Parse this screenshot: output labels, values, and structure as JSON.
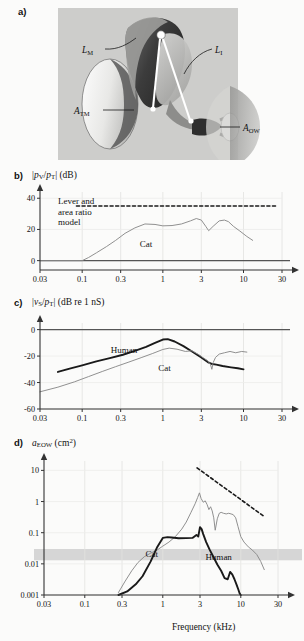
{
  "figure": {
    "background": "#fbfbfa",
    "panels": [
      "a",
      "b",
      "c",
      "d"
    ]
  },
  "panel_a": {
    "letter": "a)",
    "type": "anatomical-diagram",
    "description": "Middle ear ossicular lever diagram",
    "labels": [
      {
        "id": "lm",
        "base": "L",
        "sub": "M"
      },
      {
        "id": "li",
        "base": "L",
        "sub": "I"
      },
      {
        "id": "atm",
        "base": "A",
        "sub": "TM"
      },
      {
        "id": "aow",
        "base": "A",
        "sub": "OW"
      }
    ],
    "colors": {
      "backdrop": "#cfcfcf",
      "membrane": "#f2f2f0",
      "shadow": "#3a3a3a",
      "mid": "#8f8f8f",
      "light": "#bdbdbd"
    }
  },
  "panel_b": {
    "letter": "b)",
    "axis_title_parts": {
      "pre": "|",
      "num": "p",
      "num_sub": "V",
      "slash": "/",
      "den": "p",
      "den_sub": "T",
      "post": "| (dB)"
    },
    "model_label_lines": [
      "Lever and",
      "area ratio",
      "model"
    ],
    "curve_label": "Cat",
    "chart_data": {
      "type": "line",
      "title": "",
      "xlabel": "",
      "ylabel": "|pV/pT| (dB)",
      "xscale": "log",
      "xlim": [
        0.03,
        30
      ],
      "ylim": [
        -6,
        44
      ],
      "xticks": [
        0.03,
        0.1,
        0.3,
        1,
        3,
        10,
        30
      ],
      "xticklabels": [
        "0.03",
        "0.1",
        "0.3",
        "1",
        "3",
        "10",
        "30"
      ],
      "yticks": [
        0,
        20,
        40
      ],
      "yticklabels": [
        "0",
        "20",
        "40"
      ],
      "grid": true,
      "series": [
        {
          "name": "Lever and area ratio model",
          "style": "dashed",
          "color": "#1a1a1a",
          "x": [
            0.085,
            25
          ],
          "y": [
            35,
            35
          ]
        },
        {
          "name": "Cat",
          "style": "solid-thin",
          "color": "#8a8a8a",
          "x": [
            0.03,
            0.1,
            0.12,
            0.15,
            0.2,
            0.26,
            0.34,
            0.45,
            0.6,
            0.8,
            1.0,
            1.3,
            1.7,
            2.2,
            2.6,
            3.0,
            3.4,
            3.7,
            4.2,
            5.0,
            5.8,
            6.5,
            7.5,
            9.0,
            11.0,
            13.0
          ],
          "y": [
            0,
            0,
            2,
            5,
            9,
            13,
            17.5,
            21,
            23.5,
            23.2,
            22.3,
            22.5,
            23.5,
            25.5,
            27,
            26,
            22,
            19.2,
            22,
            25.5,
            26,
            25,
            22,
            19,
            15.5,
            13
          ]
        }
      ]
    }
  },
  "panel_c": {
    "letter": "c)",
    "axis_title_parts": {
      "pre": "|",
      "num": "v",
      "num_sub": "S",
      "slash": "/",
      "den": "p",
      "den_sub": "T",
      "post": "| (dB re 1 nS)"
    },
    "curve_labels": [
      "Human",
      "Cat"
    ],
    "chart_data": {
      "type": "line",
      "title": "",
      "xlabel": "",
      "ylabel": "|vS/pT| (dB re 1 nS)",
      "xscale": "log",
      "xlim": [
        0.03,
        30
      ],
      "ylim": [
        -60,
        5
      ],
      "xticks": [
        0.03,
        0.1,
        0.3,
        1,
        3,
        10,
        30
      ],
      "xticklabels": [
        "0.03",
        "0.1",
        "0.3",
        "1",
        "3",
        "10",
        "30"
      ],
      "yticks": [
        0,
        -20,
        -40,
        -60
      ],
      "yticklabels": [
        "0",
        "-20",
        "-40",
        "-60"
      ],
      "grid": true,
      "series": [
        {
          "name": "Human",
          "style": "solid-thick",
          "color": "#1a1a1a",
          "x": [
            0.05,
            0.07,
            0.1,
            0.15,
            0.22,
            0.32,
            0.45,
            0.62,
            0.8,
            1.0,
            1.15,
            1.4,
            1.8,
            2.3,
            3.0,
            3.6,
            4.1,
            4.6,
            5.5,
            7.0,
            8.5,
            10.0
          ],
          "y": [
            -32,
            -29.5,
            -27,
            -24,
            -21.5,
            -19,
            -16,
            -13,
            -10,
            -7.5,
            -7.2,
            -9,
            -12.5,
            -16.5,
            -21,
            -24.5,
            -26,
            -26.5,
            -27.5,
            -28.5,
            -29.2,
            -30
          ]
        },
        {
          "name": "Cat",
          "style": "solid-thin",
          "color": "#8a8a8a",
          "x": [
            0.03,
            0.05,
            0.08,
            0.12,
            0.18,
            0.26,
            0.38,
            0.55,
            0.75,
            1.0,
            1.2,
            1.5,
            1.9,
            2.3,
            2.8,
            3.2,
            3.6,
            3.9,
            4.05,
            4.2,
            4.5,
            5.0,
            5.8,
            6.8,
            8.0,
            9.5,
            11.0
          ],
          "y": [
            -47,
            -43.5,
            -39.5,
            -35.5,
            -31.5,
            -28,
            -24.5,
            -21,
            -18,
            -15,
            -14,
            -14.8,
            -16.5,
            -16,
            -19,
            -21.5,
            -23.5,
            -26.5,
            -30,
            -25,
            -21,
            -18.5,
            -17.5,
            -16.5,
            -17.5,
            -16.5,
            -17
          ]
        }
      ]
    }
  },
  "panel_d": {
    "letter": "d)",
    "axis_title_parts": {
      "base": "a",
      "sub": "EOW",
      "post": " (cm",
      "sup": "2",
      "close": ")"
    },
    "curve_labels": [
      "Cat",
      "Human"
    ],
    "xaxis_label": "Frequency (kHz)",
    "shaded_band": {
      "from": 0.013,
      "to": 0.03,
      "color": "#d6d6d6"
    },
    "chart_data": {
      "type": "line",
      "title": "",
      "xlabel": "Frequency (kHz)",
      "ylabel": "aEOW (cm2)",
      "xscale": "log",
      "yscale": "log",
      "xlim": [
        0.03,
        30
      ],
      "ylim": [
        0.001,
        20
      ],
      "xticks": [
        0.03,
        0.1,
        0.3,
        1,
        3,
        10,
        30
      ],
      "xticklabels": [
        "0.03",
        "0.1",
        "0.3",
        "1",
        "3",
        "10",
        "30"
      ],
      "yticks": [
        0.001,
        0.01,
        0.1,
        1,
        10
      ],
      "yticklabels": [
        "0.001",
        "0.01",
        "0.1",
        "1",
        "10"
      ],
      "grid": true,
      "series": [
        {
          "name": "reference-slope",
          "style": "dashed",
          "color": "#1a1a1a",
          "x": [
            2.75,
            20
          ],
          "y": [
            12,
            0.33
          ]
        },
        {
          "name": "Cat",
          "style": "solid-thin",
          "color": "#8a8a8a",
          "x": [
            0.27,
            0.33,
            0.4,
            0.48,
            0.58,
            0.7,
            0.85,
            1.0,
            1.2,
            1.45,
            1.75,
            2.0,
            2.3,
            2.6,
            2.8,
            2.95,
            3.1,
            3.3,
            3.5,
            3.7,
            3.9,
            4.1,
            4.3,
            4.5,
            4.7,
            5.0,
            5.3,
            5.6,
            6.0,
            6.5,
            7.0,
            7.5,
            8.0,
            8.6,
            9.2,
            10.0,
            11.0,
            12.5,
            14.0,
            16.0,
            18.0,
            20.0
          ],
          "y": [
            0.0012,
            0.0028,
            0.006,
            0.011,
            0.017,
            0.022,
            0.028,
            0.037,
            0.05,
            0.075,
            0.13,
            0.22,
            0.45,
            0.85,
            1.35,
            1.9,
            1.25,
            0.95,
            1.05,
            0.8,
            0.55,
            0.68,
            0.5,
            0.3,
            0.12,
            0.28,
            0.42,
            0.45,
            0.42,
            0.4,
            0.42,
            0.4,
            0.38,
            0.3,
            0.16,
            0.075,
            0.05,
            0.035,
            0.028,
            0.02,
            0.012,
            0.0065
          ]
        },
        {
          "name": "Human",
          "style": "solid-thick",
          "color": "#1a1a1a",
          "x": [
            0.27,
            0.35,
            0.45,
            0.55,
            0.7,
            0.85,
            1.0,
            1.15,
            1.3,
            1.6,
            2.0,
            2.4,
            2.7,
            2.85,
            3.0,
            3.15,
            3.3,
            3.6,
            4.0,
            4.5,
            5.0,
            5.6,
            6.2,
            6.8,
            7.3,
            7.8,
            8.3,
            8.8,
            9.3,
            9.7,
            10.0
          ],
          "y": [
            0.001,
            0.0013,
            0.0022,
            0.004,
            0.012,
            0.035,
            0.068,
            0.072,
            0.07,
            0.066,
            0.067,
            0.068,
            0.085,
            0.075,
            0.15,
            0.13,
            0.09,
            0.05,
            0.028,
            0.016,
            0.0095,
            0.006,
            0.0035,
            0.0032,
            0.0055,
            0.0045,
            0.0032,
            0.0022,
            0.0015,
            0.0011,
            0.001
          ]
        }
      ]
    }
  }
}
